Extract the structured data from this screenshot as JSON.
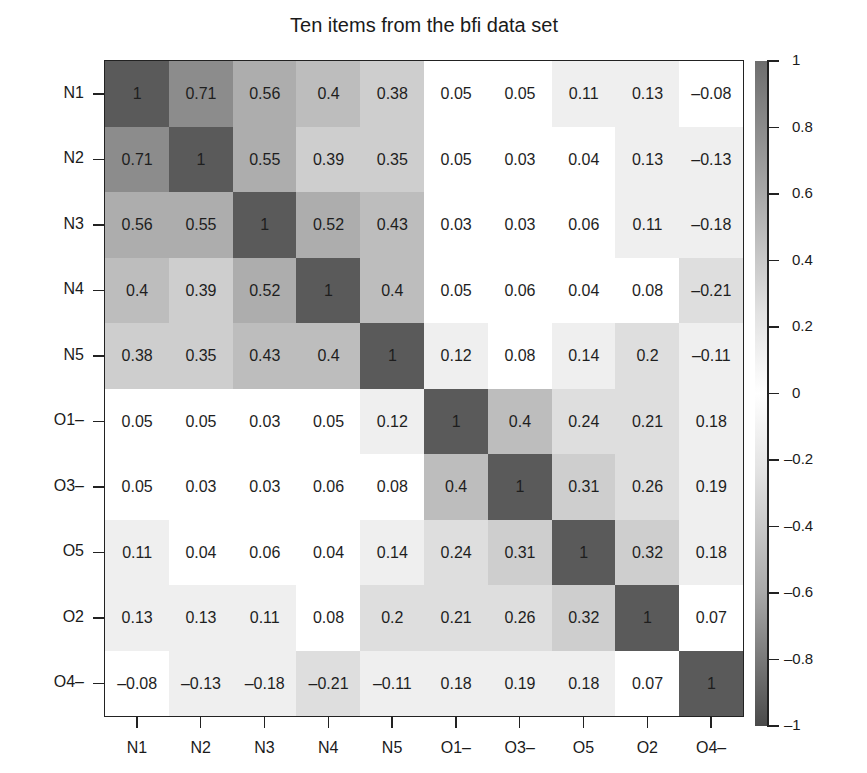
{
  "chart_data": {
    "type": "heatmap",
    "title": "Ten items from the bfi data set",
    "xlabel": "",
    "ylabel": "",
    "rows": [
      "N1",
      "N2",
      "N3",
      "N4",
      "N5",
      "O1–",
      "O3–",
      "O5",
      "O2",
      "O4–"
    ],
    "columns": [
      "N1",
      "N2",
      "N3",
      "N4",
      "N5",
      "O1–",
      "O3–",
      "O5",
      "O2",
      "O4–"
    ],
    "values": [
      [
        1,
        0.71,
        0.56,
        0.4,
        0.38,
        0.05,
        0.05,
        0.11,
        0.13,
        -0.08
      ],
      [
        0.71,
        1,
        0.55,
        0.39,
        0.35,
        0.05,
        0.03,
        0.04,
        0.13,
        -0.13
      ],
      [
        0.56,
        0.55,
        1,
        0.52,
        0.43,
        0.03,
        0.03,
        0.06,
        0.11,
        -0.18
      ],
      [
        0.4,
        0.39,
        0.52,
        1,
        0.4,
        0.05,
        0.06,
        0.04,
        0.08,
        -0.21
      ],
      [
        0.38,
        0.35,
        0.43,
        0.4,
        1,
        0.12,
        0.08,
        0.14,
        0.2,
        -0.11
      ],
      [
        0.05,
        0.05,
        0.03,
        0.05,
        0.12,
        1,
        0.4,
        0.24,
        0.21,
        0.18
      ],
      [
        0.05,
        0.03,
        0.03,
        0.06,
        0.08,
        0.4,
        1,
        0.31,
        0.26,
        0.19
      ],
      [
        0.11,
        0.04,
        0.06,
        0.04,
        0.14,
        0.24,
        0.31,
        1,
        0.32,
        0.18
      ],
      [
        0.13,
        0.13,
        0.11,
        0.08,
        0.2,
        0.21,
        0.26,
        0.32,
        1,
        0.07
      ],
      [
        -0.08,
        -0.13,
        -0.18,
        -0.21,
        -0.11,
        0.18,
        0.19,
        0.18,
        0.07,
        1
      ]
    ],
    "colorbar": {
      "ticks": [
        1,
        0.8,
        0.6,
        0.4,
        0.2,
        0,
        -0.2,
        -0.4,
        -0.6,
        -0.8,
        -1
      ],
      "tick_labels": [
        "1",
        "0.8",
        "0.6",
        "0.4",
        "0.2",
        "0",
        "–0.2",
        "–0.4",
        "–0.6",
        "–0.8",
        "–1"
      ],
      "range": [
        -1,
        1
      ],
      "colors": {
        "extreme": "#5a5a5a",
        "center": "#ffffff"
      }
    },
    "legend_position": "right",
    "grid": false
  }
}
